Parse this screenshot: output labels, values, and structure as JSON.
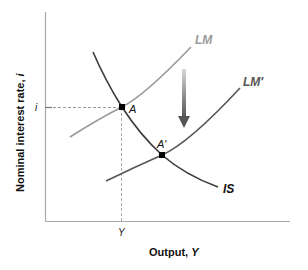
{
  "diagram": {
    "type": "IS-LM shift",
    "y_axis": {
      "title_prefix": "Nominal interest rate, ",
      "title_var": "i",
      "tick_label": "i"
    },
    "x_axis": {
      "title_prefix": "Output, ",
      "title_var": "Y",
      "tick_label": "Y"
    },
    "curves": {
      "IS": {
        "label": "IS",
        "color": "#3a3a3a"
      },
      "LM": {
        "label": "LM",
        "color": "#9a9a9a"
      },
      "LM_prime": {
        "label": "LM′",
        "color": "#5a5a5a"
      }
    },
    "points": {
      "A": {
        "label": "A"
      },
      "A_prime": {
        "label": "A′"
      }
    },
    "arrow": {
      "direction": "down",
      "meaning": "LM shifts down to LM′",
      "color_top": "#d0d0d0",
      "color_bottom": "#555555"
    },
    "colors": {
      "axis": "#aaaaaa",
      "dashed_guides": "#aaaaaa",
      "point": "#000000"
    }
  }
}
